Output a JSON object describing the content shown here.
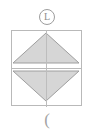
{
  "canvas": {
    "width": 94,
    "height": 133,
    "background": "#ffffff"
  },
  "badge": {
    "icon_name": "circled-l-icon",
    "glyph": "L",
    "border_color": "#9d9d9d",
    "text_color": "#8e8e8e"
  },
  "frame": {
    "border_color": "#b9b9b9",
    "fill": "#ffffff",
    "divider_color": "#b9b9b9",
    "spine_color": "#bdbdbd"
  },
  "cells": [
    {
      "name": "increment-cell",
      "icon_name": "triangle-up-icon",
      "direction": "up",
      "fill": "#d6d6d6",
      "stroke": "#9e9e9e",
      "points": "35,3 68,33 2,33"
    },
    {
      "name": "decrement-cell",
      "icon_name": "triangle-down-icon",
      "direction": "down",
      "fill": "#d6d6d6",
      "stroke": "#9e9e9e",
      "points": "2,3 68,3 35,33"
    }
  ],
  "footer": {
    "glyph": "(",
    "color": "#a3a3a3"
  }
}
